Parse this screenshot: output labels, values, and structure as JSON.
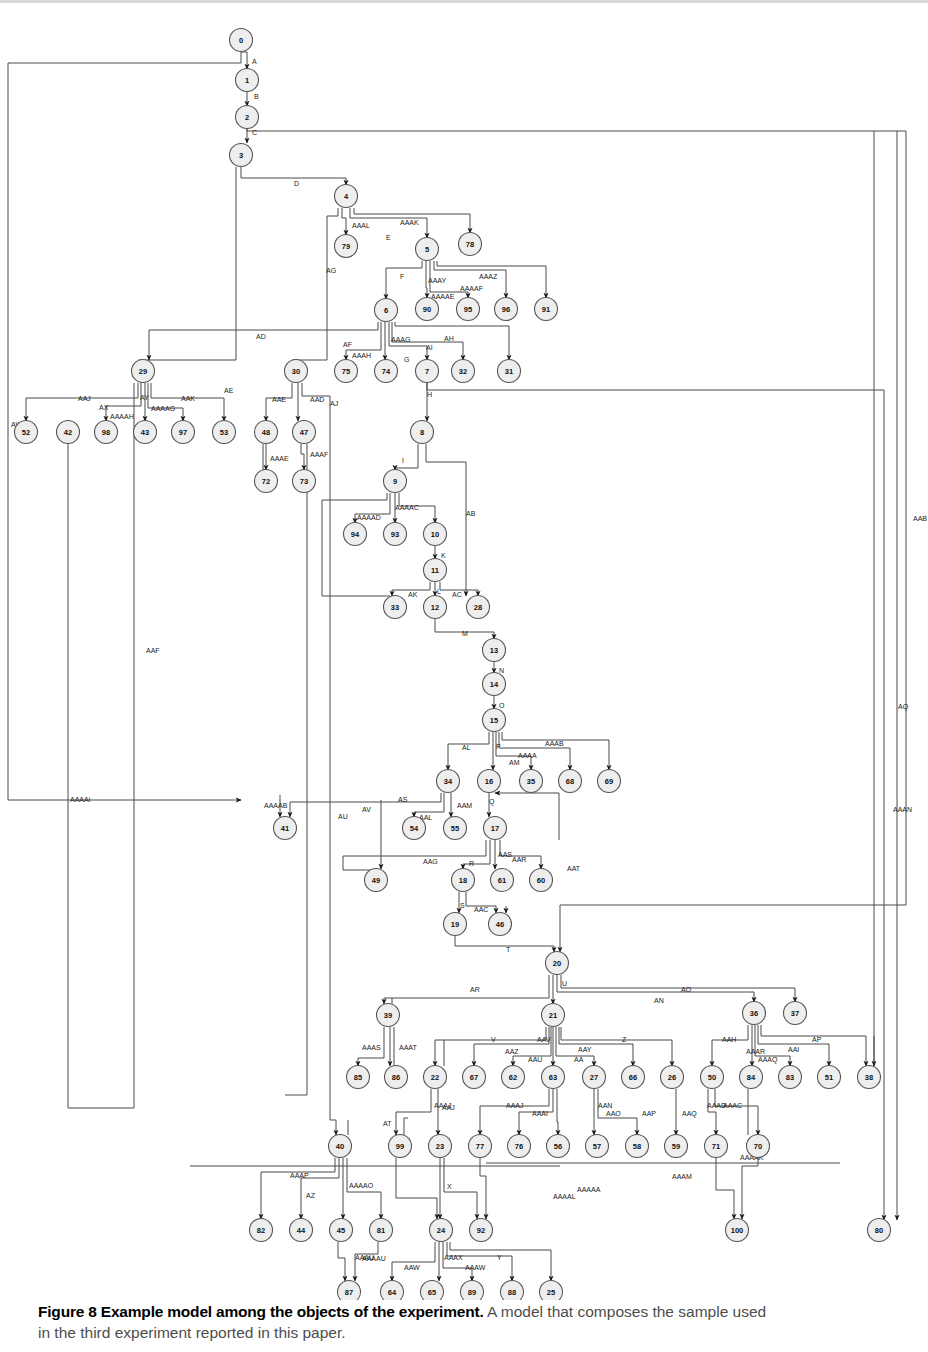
{
  "figure": {
    "caption_bold": "Figure 8 Example model among the objects of the experiment.",
    "caption_rest": " A model that composes the sample used",
    "caption_line2": "in the third experiment reported in this paper."
  },
  "chart_data": {
    "type": "diagram",
    "title": "Figure 8 Example model among the objects of the experiment.",
    "layout": "layered directed acyclic graph, orthogonal edge routing, top-to-bottom",
    "node_shape": "circle",
    "node_fill": "#eeeeee",
    "node_stroke": "#555555",
    "edge_stroke": "#4a4a4a",
    "node_count": 101,
    "nodes": [
      {
        "id": "0",
        "x": 241,
        "y": 40
      },
      {
        "id": "1",
        "x": 247,
        "y": 80
      },
      {
        "id": "2",
        "x": 247,
        "y": 117
      },
      {
        "id": "3",
        "x": 241,
        "y": 155
      },
      {
        "id": "4",
        "x": 346,
        "y": 196
      },
      {
        "id": "79",
        "x": 346,
        "y": 246
      },
      {
        "id": "5",
        "x": 427,
        "y": 249
      },
      {
        "id": "78",
        "x": 470,
        "y": 244
      },
      {
        "id": "6",
        "x": 386,
        "y": 310
      },
      {
        "id": "90",
        "x": 427,
        "y": 309
      },
      {
        "id": "95",
        "x": 468,
        "y": 309
      },
      {
        "id": "96",
        "x": 506,
        "y": 309
      },
      {
        "id": "91",
        "x": 546,
        "y": 309
      },
      {
        "id": "29",
        "x": 143,
        "y": 371
      },
      {
        "id": "30",
        "x": 296,
        "y": 371
      },
      {
        "id": "75",
        "x": 346,
        "y": 371
      },
      {
        "id": "74",
        "x": 386,
        "y": 371
      },
      {
        "id": "7",
        "x": 427,
        "y": 371
      },
      {
        "id": "32",
        "x": 463,
        "y": 371
      },
      {
        "id": "31",
        "x": 509,
        "y": 371
      },
      {
        "id": "52",
        "x": 26,
        "y": 432
      },
      {
        "id": "42",
        "x": 68,
        "y": 432
      },
      {
        "id": "98",
        "x": 106,
        "y": 432
      },
      {
        "id": "43",
        "x": 145,
        "y": 432
      },
      {
        "id": "97",
        "x": 183,
        "y": 432
      },
      {
        "id": "53",
        "x": 224,
        "y": 432
      },
      {
        "id": "48",
        "x": 266,
        "y": 432
      },
      {
        "id": "47",
        "x": 304,
        "y": 432
      },
      {
        "id": "8",
        "x": 422,
        "y": 432
      },
      {
        "id": "72",
        "x": 266,
        "y": 481
      },
      {
        "id": "73",
        "x": 304,
        "y": 481
      },
      {
        "id": "9",
        "x": 395,
        "y": 481
      },
      {
        "id": "94",
        "x": 355,
        "y": 534
      },
      {
        "id": "93",
        "x": 395,
        "y": 534
      },
      {
        "id": "10",
        "x": 435,
        "y": 534
      },
      {
        "id": "11",
        "x": 435,
        "y": 570
      },
      {
        "id": "33",
        "x": 395,
        "y": 607
      },
      {
        "id": "12",
        "x": 435,
        "y": 607
      },
      {
        "id": "28",
        "x": 478,
        "y": 607
      },
      {
        "id": "13",
        "x": 494,
        "y": 650
      },
      {
        "id": "14",
        "x": 494,
        "y": 684
      },
      {
        "id": "15",
        "x": 494,
        "y": 720
      },
      {
        "id": "34",
        "x": 448,
        "y": 781
      },
      {
        "id": "16",
        "x": 489,
        "y": 781
      },
      {
        "id": "35",
        "x": 531,
        "y": 781
      },
      {
        "id": "68",
        "x": 570,
        "y": 781
      },
      {
        "id": "69",
        "x": 609,
        "y": 781
      },
      {
        "id": "41",
        "x": 285,
        "y": 828
      },
      {
        "id": "54",
        "x": 414,
        "y": 828
      },
      {
        "id": "55",
        "x": 455,
        "y": 828
      },
      {
        "id": "17",
        "x": 495,
        "y": 828
      },
      {
        "id": "49",
        "x": 376,
        "y": 880
      },
      {
        "id": "18",
        "x": 463,
        "y": 880
      },
      {
        "id": "61",
        "x": 502,
        "y": 880
      },
      {
        "id": "60",
        "x": 541,
        "y": 880
      },
      {
        "id": "19",
        "x": 455,
        "y": 924
      },
      {
        "id": "46",
        "x": 500,
        "y": 924
      },
      {
        "id": "20",
        "x": 557,
        "y": 963
      },
      {
        "id": "39",
        "x": 388,
        "y": 1015
      },
      {
        "id": "21",
        "x": 553,
        "y": 1015
      },
      {
        "id": "36",
        "x": 754,
        "y": 1013
      },
      {
        "id": "37",
        "x": 795,
        "y": 1013
      },
      {
        "id": "85",
        "x": 358,
        "y": 1077
      },
      {
        "id": "86",
        "x": 396,
        "y": 1077
      },
      {
        "id": "22",
        "x": 435,
        "y": 1077
      },
      {
        "id": "67",
        "x": 474,
        "y": 1077
      },
      {
        "id": "62",
        "x": 513,
        "y": 1077
      },
      {
        "id": "63",
        "x": 553,
        "y": 1077
      },
      {
        "id": "27",
        "x": 594,
        "y": 1077
      },
      {
        "id": "66",
        "x": 633,
        "y": 1077
      },
      {
        "id": "26",
        "x": 672,
        "y": 1077
      },
      {
        "id": "50",
        "x": 712,
        "y": 1077
      },
      {
        "id": "84",
        "x": 751,
        "y": 1077
      },
      {
        "id": "83",
        "x": 790,
        "y": 1077
      },
      {
        "id": "51",
        "x": 829,
        "y": 1077
      },
      {
        "id": "38",
        "x": 869,
        "y": 1077
      },
      {
        "id": "40",
        "x": 340,
        "y": 1146
      },
      {
        "id": "99",
        "x": 400,
        "y": 1146
      },
      {
        "id": "23",
        "x": 440,
        "y": 1146
      },
      {
        "id": "77",
        "x": 480,
        "y": 1146
      },
      {
        "id": "76",
        "x": 519,
        "y": 1146
      },
      {
        "id": "56",
        "x": 558,
        "y": 1146
      },
      {
        "id": "57",
        "x": 597,
        "y": 1146
      },
      {
        "id": "58",
        "x": 637,
        "y": 1146
      },
      {
        "id": "59",
        "x": 676,
        "y": 1146
      },
      {
        "id": "71",
        "x": 716,
        "y": 1146
      },
      {
        "id": "70",
        "x": 758,
        "y": 1146
      },
      {
        "id": "82",
        "x": 261,
        "y": 1230
      },
      {
        "id": "44",
        "x": 301,
        "y": 1230
      },
      {
        "id": "45",
        "x": 341,
        "y": 1230
      },
      {
        "id": "81",
        "x": 381,
        "y": 1230
      },
      {
        "id": "24",
        "x": 441,
        "y": 1230
      },
      {
        "id": "92",
        "x": 481,
        "y": 1230
      },
      {
        "id": "100",
        "x": 737,
        "y": 1230
      },
      {
        "id": "80",
        "x": 879,
        "y": 1230
      },
      {
        "id": "87",
        "x": 349,
        "y": 1292
      },
      {
        "id": "64",
        "x": 392,
        "y": 1292
      },
      {
        "id": "65",
        "x": 432,
        "y": 1292
      },
      {
        "id": "89",
        "x": 472,
        "y": 1292
      },
      {
        "id": "88",
        "x": 512,
        "y": 1292
      },
      {
        "id": "25",
        "x": 551,
        "y": 1292
      }
    ],
    "edge_labels": [
      {
        "text": "A",
        "x": 252,
        "y": 62
      },
      {
        "text": "B",
        "x": 254,
        "y": 97
      },
      {
        "text": "C",
        "x": 252,
        "y": 133
      },
      {
        "text": "D",
        "x": 294,
        "y": 184
      },
      {
        "text": "AE",
        "x": 224,
        "y": 391
      },
      {
        "text": "AAAL",
        "x": 352,
        "y": 226
      },
      {
        "text": "E",
        "x": 386,
        "y": 238
      },
      {
        "text": "AAAK",
        "x": 400,
        "y": 223
      },
      {
        "text": "AG",
        "x": 326,
        "y": 271
      },
      {
        "text": "F",
        "x": 400,
        "y": 277
      },
      {
        "text": "AAAY",
        "x": 428,
        "y": 281
      },
      {
        "text": "AAAZ",
        "x": 479,
        "y": 277
      },
      {
        "text": "AAAAF",
        "x": 460,
        "y": 289
      },
      {
        "text": "AAAAE",
        "x": 431,
        "y": 297
      },
      {
        "text": "AD",
        "x": 256,
        "y": 337
      },
      {
        "text": "AF",
        "x": 343,
        "y": 345
      },
      {
        "text": "AAAH",
        "x": 352,
        "y": 356
      },
      {
        "text": "AAAG",
        "x": 391,
        "y": 340
      },
      {
        "text": "AH",
        "x": 444,
        "y": 339
      },
      {
        "text": "AI",
        "x": 426,
        "y": 348
      },
      {
        "text": "G",
        "x": 404,
        "y": 360
      },
      {
        "text": "AAJ",
        "x": 78,
        "y": 399
      },
      {
        "text": "AX",
        "x": 99,
        "y": 408
      },
      {
        "text": "AY",
        "x": 140,
        "y": 398
      },
      {
        "text": "AAK",
        "x": 181,
        "y": 399
      },
      {
        "text": "AAAAH",
        "x": 110,
        "y": 417
      },
      {
        "text": "AAAAG",
        "x": 151,
        "y": 409
      },
      {
        "text": "AW",
        "x": 11,
        "y": 425
      },
      {
        "text": "AAE",
        "x": 272,
        "y": 400
      },
      {
        "text": "AAD",
        "x": 310,
        "y": 400
      },
      {
        "text": "AJ",
        "x": 330,
        "y": 404
      },
      {
        "text": "H",
        "x": 427,
        "y": 395
      },
      {
        "text": "AAAE",
        "x": 270,
        "y": 459
      },
      {
        "text": "AAAF",
        "x": 310,
        "y": 455
      },
      {
        "text": "I",
        "x": 402,
        "y": 461
      },
      {
        "text": "AAAAC",
        "x": 395,
        "y": 508
      },
      {
        "text": "AAAAD",
        "x": 357,
        "y": 518
      },
      {
        "text": "AB",
        "x": 466,
        "y": 514
      },
      {
        "text": "K",
        "x": 441,
        "y": 556
      },
      {
        "text": "AK",
        "x": 408,
        "y": 595
      },
      {
        "text": "L",
        "x": 437,
        "y": 592
      },
      {
        "text": "AC",
        "x": 452,
        "y": 595
      },
      {
        "text": "M",
        "x": 462,
        "y": 634
      },
      {
        "text": "N",
        "x": 499,
        "y": 671
      },
      {
        "text": "O",
        "x": 499,
        "y": 706
      },
      {
        "text": "P",
        "x": 496,
        "y": 747
      },
      {
        "text": "AL",
        "x": 462,
        "y": 748
      },
      {
        "text": "AAAB",
        "x": 545,
        "y": 744
      },
      {
        "text": "AAAA",
        "x": 518,
        "y": 756
      },
      {
        "text": "AM",
        "x": 509,
        "y": 763
      },
      {
        "text": "AAAAB",
        "x": 264,
        "y": 806
      },
      {
        "text": "AS",
        "x": 398,
        "y": 800
      },
      {
        "text": "AV",
        "x": 362,
        "y": 810
      },
      {
        "text": "AU",
        "x": 338,
        "y": 817
      },
      {
        "text": "AAL",
        "x": 419,
        "y": 818
      },
      {
        "text": "AAM",
        "x": 457,
        "y": 806
      },
      {
        "text": "Q",
        "x": 489,
        "y": 802
      },
      {
        "text": "AAG",
        "x": 423,
        "y": 862
      },
      {
        "text": "R",
        "x": 469,
        "y": 864
      },
      {
        "text": "AAS",
        "x": 498,
        "y": 855
      },
      {
        "text": "AAR",
        "x": 512,
        "y": 860
      },
      {
        "text": "AAT",
        "x": 567,
        "y": 869
      },
      {
        "text": "S",
        "x": 460,
        "y": 906
      },
      {
        "text": "AAC",
        "x": 474,
        "y": 910
      },
      {
        "text": "T",
        "x": 506,
        "y": 950
      },
      {
        "text": "U",
        "x": 562,
        "y": 984
      },
      {
        "text": "AR",
        "x": 470,
        "y": 990
      },
      {
        "text": "AN",
        "x": 654,
        "y": 1001
      },
      {
        "text": "AO",
        "x": 681,
        "y": 990
      },
      {
        "text": "AAAS",
        "x": 362,
        "y": 1048
      },
      {
        "text": "AAAT",
        "x": 399,
        "y": 1048
      },
      {
        "text": "V",
        "x": 491,
        "y": 1040
      },
      {
        "text": "AAZ",
        "x": 505,
        "y": 1052
      },
      {
        "text": "AAU",
        "x": 528,
        "y": 1060
      },
      {
        "text": "AAV",
        "x": 537,
        "y": 1040
      },
      {
        "text": "AA",
        "x": 574,
        "y": 1060
      },
      {
        "text": "AAY",
        "x": 578,
        "y": 1050
      },
      {
        "text": "Z",
        "x": 622,
        "y": 1040
      },
      {
        "text": "AAH",
        "x": 722,
        "y": 1040
      },
      {
        "text": "AAAR",
        "x": 746,
        "y": 1052
      },
      {
        "text": "AAI",
        "x": 788,
        "y": 1050
      },
      {
        "text": "AP",
        "x": 812,
        "y": 1040
      },
      {
        "text": "AAAQ",
        "x": 758,
        "y": 1060
      },
      {
        "text": "AT",
        "x": 383,
        "y": 1124
      },
      {
        "text": "AAAJ",
        "x": 434,
        "y": 1106
      },
      {
        "text": "AAJ",
        "x": 442,
        "y": 1108
      },
      {
        "text": "AAAJ",
        "x": 506,
        "y": 1106
      },
      {
        "text": "AAAI",
        "x": 532,
        "y": 1114
      },
      {
        "text": "AAN",
        "x": 598,
        "y": 1106
      },
      {
        "text": "AAO",
        "x": 606,
        "y": 1114
      },
      {
        "text": "AAP",
        "x": 642,
        "y": 1114
      },
      {
        "text": "AAQ",
        "x": 682,
        "y": 1114
      },
      {
        "text": "AAAD",
        "x": 707,
        "y": 1106
      },
      {
        "text": "AAAC",
        "x": 723,
        "y": 1106
      },
      {
        "text": "AAAAK",
        "x": 740,
        "y": 1158
      },
      {
        "text": "AAAP",
        "x": 290,
        "y": 1176
      },
      {
        "text": "AZ",
        "x": 306,
        "y": 1196
      },
      {
        "text": "AAAAO",
        "x": 349,
        "y": 1186
      },
      {
        "text": "X",
        "x": 447,
        "y": 1187
      },
      {
        "text": "AAAM",
        "x": 672,
        "y": 1177
      },
      {
        "text": "AAAAA",
        "x": 577,
        "y": 1190
      },
      {
        "text": "AAAAL",
        "x": 553,
        "y": 1197
      },
      {
        "text": "AAAU",
        "x": 355,
        "y": 1258
      },
      {
        "text": "AAAAU",
        "x": 362,
        "y": 1259
      },
      {
        "text": "AAW",
        "x": 404,
        "y": 1268
      },
      {
        "text": "AAAX",
        "x": 444,
        "y": 1258
      },
      {
        "text": "AAAW",
        "x": 465,
        "y": 1268
      },
      {
        "text": "Y",
        "x": 497,
        "y": 1258
      },
      {
        "text": "AAB",
        "x": 913,
        "y": 519
      },
      {
        "text": "AQ",
        "x": 898,
        "y": 707
      },
      {
        "text": "AAAN",
        "x": 893,
        "y": 810
      },
      {
        "text": "AAF",
        "x": 146,
        "y": 651
      },
      {
        "text": "AAAAi",
        "x": 70,
        "y": 800
      }
    ]
  }
}
